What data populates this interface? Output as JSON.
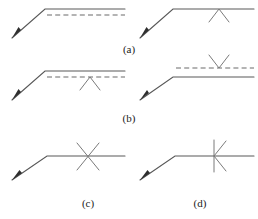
{
  "figure": {
    "width": 258,
    "height": 219,
    "background_color": "#ffffff",
    "colors": {
      "solid_line": "#585858",
      "dashed_line": "#6a6a6a",
      "mark": "#7a7a7a",
      "arrow_head": "#2e2e2e",
      "label_text": "#1b1b1b"
    },
    "panels": [
      {
        "id": "panel-a",
        "label": "(a)",
        "label_x": 129,
        "label_y": 53,
        "diagrams": [
          {
            "id": "diagram-a-left",
            "arrow_polyline": "12,38 45,9 125,9",
            "arrow_tip": {
              "x": 12,
              "y": 38,
              "angle_deg": 221
            },
            "dashed_line": {
              "x1": 47,
              "y1": 15,
              "x2": 125,
              "y2": 15
            },
            "mark": {
              "type": "none"
            }
          },
          {
            "id": "diagram-a-right",
            "arrow_polyline": "140,38 173,9 254,9",
            "arrow_tip": {
              "x": 140,
              "y": 38,
              "angle_deg": 221
            },
            "dashed_line": null,
            "mark": {
              "type": "chevron-up",
              "x": 219,
              "y": 9,
              "half_width": 10,
              "height": 13
            }
          }
        ]
      },
      {
        "id": "panel-b",
        "label": "(b)",
        "label_x": 129,
        "label_y": 122,
        "diagrams": [
          {
            "id": "diagram-b-left",
            "arrow_polyline": "12,100 45,71 125,71",
            "arrow_tip": {
              "x": 12,
              "y": 100,
              "angle_deg": 221
            },
            "dashed_line": {
              "x1": 47,
              "y1": 77,
              "x2": 125,
              "y2": 77
            },
            "mark": {
              "type": "chevron-up-open-down",
              "x": 90,
              "y": 77,
              "half_width": 10,
              "height": 13
            }
          },
          {
            "id": "diagram-b-right",
            "arrow_polyline": "140,100 173,77 254,77",
            "arrow_tip": {
              "x": 140,
              "y": 100,
              "angle_deg": 216
            },
            "dashed_line": {
              "x1": 176,
              "y1": 68,
              "x2": 254,
              "y2": 68
            },
            "mark": {
              "type": "chevron-down",
              "x": 219,
              "y": 68,
              "half_width": 10,
              "height": 13
            }
          }
        ]
      },
      {
        "id": "panel-c",
        "label": "(c)",
        "label_x": 88,
        "label_y": 207,
        "diagrams": [
          {
            "id": "diagram-c",
            "arrow_polyline": "12,180 47,156 125,156",
            "arrow_tip": {
              "x": 12,
              "y": 180,
              "angle_deg": 214
            },
            "dashed_line": null,
            "mark": {
              "type": "cross-x",
              "x": 88,
              "y": 156,
              "half_width": 12,
              "half_height": 14
            }
          }
        ]
      },
      {
        "id": "panel-d",
        "label": "(d)",
        "label_x": 200,
        "label_y": 207,
        "diagrams": [
          {
            "id": "diagram-d",
            "arrow_polyline": "140,180 175,156 254,156",
            "arrow_tip": {
              "x": 140,
              "y": 180,
              "angle_deg": 214
            },
            "dashed_line": null,
            "mark": {
              "type": "vertical-bar-with-k",
              "x": 215,
              "y": 156,
              "half_height": 16,
              "k_width": 12
            }
          }
        ]
      }
    ]
  }
}
